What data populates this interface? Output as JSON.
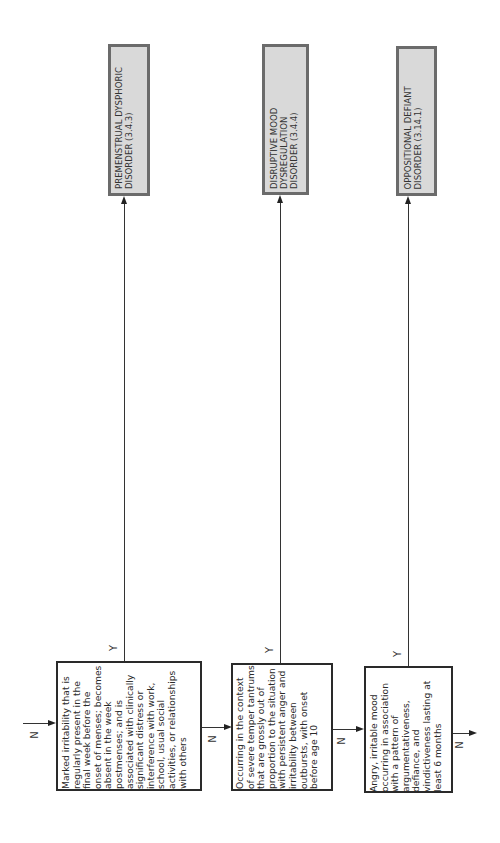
{
  "diagram": {
    "orientation": "rotated-90-ccw",
    "entry_label": "N",
    "criteria": [
      {
        "id": "criterion-1",
        "text": "Marked irritability that is\nregularly present in the\nfinal week before the\nonset of menses; becomes\nabsent in the week\npostmenses; and is\nassociated with clinically\nsignificant distress or\ninterference with work,\nschool, usual social\nactivities, or relationships\nwith others",
        "yes_label": "Y",
        "no_label": "N"
      },
      {
        "id": "criterion-2",
        "text": "Occurring in the context\nof severe temper tantrums\nthat are grossly out of\nproportion to the situation\nwith persistent anger and\nirritability between\noutbursts, with onset\nbefore age 10",
        "yes_label": "Y",
        "no_label": "N"
      },
      {
        "id": "criterion-3",
        "text": "Angry, irritable mood\noccurring in association\nwith a pattern of\nargumentativeness,\ndefiance, and\nvindictiveness lasting at\nleast 6 months",
        "yes_label": "Y",
        "no_label": "N"
      }
    ],
    "diagnoses": [
      {
        "id": "pmdd",
        "text": "PREMENSTRUAL DYSPHORIC\nDISORDER (3.4.3)"
      },
      {
        "id": "dmdd",
        "text": "DISRUPTIVE MOOD\nDYSREGULATION\nDISORDER (3.4.4)"
      },
      {
        "id": "odd",
        "text": "OPPOSITIONAL DEFIANT\nDISORDER (3.14.1)"
      }
    ],
    "colors": {
      "diagnosis_fill": "#d9d9d9",
      "diagnosis_border": "#6b6b6b",
      "criterion_border": "#2a2a2a",
      "line": "#333333"
    }
  }
}
